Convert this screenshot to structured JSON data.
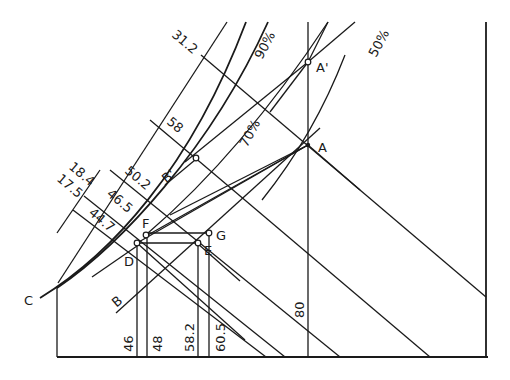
{
  "diagram": {
    "title": "",
    "points": {
      "A": "A",
      "A_prime": "A'",
      "B": "B",
      "B_prime": "B'",
      "C": "C",
      "D": "D",
      "E": "E",
      "F": "F",
      "G": "G"
    },
    "curve_labels": {
      "pct_90": "90%",
      "pct_70": "70%",
      "pct_50": "50%"
    },
    "diagonal_scale_labels": {
      "v31_2": "31.2",
      "v58": "58",
      "v50_2": "50.2",
      "v18_4": "18.4",
      "v17_5": "17.5",
      "v46_5": "46.5",
      "v44_7": "44.7"
    },
    "vertical_scale_labels": {
      "v46": "46",
      "v48": "48",
      "v58_2": "58.2",
      "v60_5": "60.5",
      "v80": "80"
    }
  }
}
